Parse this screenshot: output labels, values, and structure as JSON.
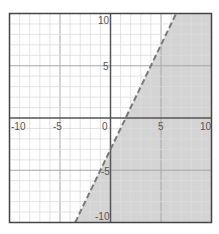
{
  "chart_data": {
    "type": "inequality-graph",
    "title": "",
    "xlabel": "",
    "ylabel": "",
    "xlim": [
      -10,
      10
    ],
    "ylim": [
      -10,
      10
    ],
    "grid": true,
    "minor_step": 1,
    "major_step": 5,
    "x_tick_labels": [
      "-10",
      "-5",
      "0",
      "5",
      "10"
    ],
    "y_tick_labels": [
      "10",
      "5",
      "-5",
      "-10"
    ],
    "boundary_line": {
      "equation": "y = 2x - 3",
      "slope": 2,
      "intercept": -3,
      "style": "dashed",
      "points": [
        [
          -3.5,
          -10
        ],
        [
          1.5,
          0
        ],
        [
          0,
          -3
        ],
        [
          6.5,
          10
        ]
      ]
    },
    "shaded_region": "y < 2x - 3",
    "inequality": "y < 2x - 3",
    "colors": {
      "shade": "#d4d4d4",
      "boundary": "#7a7a7a",
      "axis": "#555555",
      "frame": "#444444",
      "minor_grid": "#dcdcdc",
      "major_grid": "#a8a8a8"
    }
  }
}
